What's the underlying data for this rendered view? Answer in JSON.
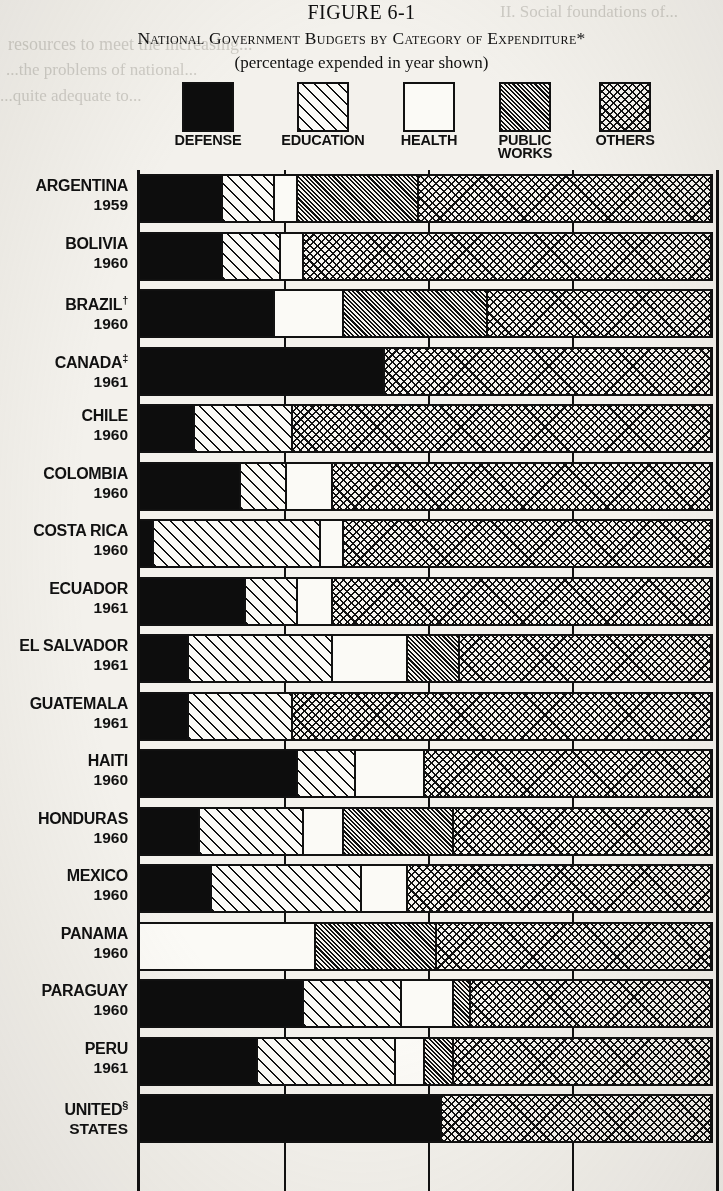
{
  "figure": {
    "number": "FIGURE 6-1",
    "title": "National Government Budgets by Category of Expenditure*",
    "subtitle": "(percentage expended in year shown)"
  },
  "bleed_text": {
    "line1": "II. Social foundations of...",
    "line2": "resources to meet the increasing...",
    "line3": "...the problems of national...",
    "line4": "...quite adequate to...",
    "line5": "..."
  },
  "legend": {
    "items": [
      {
        "label": "DEFENSE",
        "pattern": "p-defense",
        "left": 30,
        "width": 96
      },
      {
        "label": "EDUCATION",
        "pattern": "p-education",
        "left": 140,
        "width": 106
      },
      {
        "label": "HEALTH",
        "pattern": "p-health",
        "left": 258,
        "width": 82
      },
      {
        "label": "PUBLIC\nWORKS",
        "pattern": "p-public",
        "left": 352,
        "width": 86
      },
      {
        "label": "OTHERS",
        "pattern": "p-others",
        "left": 452,
        "width": 86
      }
    ]
  },
  "axis": {
    "gridlines_percent": [
      25,
      50,
      75
    ],
    "range": [
      0,
      100
    ]
  },
  "chart_data": {
    "type": "bar",
    "subtype": "stacked-horizontal-100pct",
    "title": "National Government Budgets by Category of Expenditure*",
    "subtitle": "(percentage expended in year shown)",
    "xlabel": "",
    "ylabel": "",
    "xlim": [
      0,
      100
    ],
    "grid": true,
    "gridlines": [
      25,
      50,
      75
    ],
    "legend_position": "top",
    "series": [
      {
        "name": "DEFENSE",
        "pattern": "p-defense"
      },
      {
        "name": "EDUCATION",
        "pattern": "p-education"
      },
      {
        "name": "HEALTH",
        "pattern": "p-health"
      },
      {
        "name": "PUBLIC WORKS",
        "pattern": "p-public"
      },
      {
        "name": "OTHERS",
        "pattern": "p-others"
      }
    ],
    "categories": [
      "ARGENTINA 1959",
      "BOLIVIA 1960",
      "BRAZIL† 1960",
      "CANADA‡ 1961",
      "CHILE 1960",
      "COLOMBIA 1960",
      "COSTA RICA 1960",
      "ECUADOR 1961",
      "EL SALVADOR 1961",
      "GUATEMALA 1961",
      "HAITI 1960",
      "HONDURAS 1960",
      "MEXICO 1960",
      "PANAMA 1960",
      "PARAGUAY 1960",
      "PERU 1961",
      "UNITED STATES§"
    ],
    "rows": [
      {
        "country": "ARGENTINA",
        "year": "1959",
        "marker": "",
        "values": [
          15,
          9,
          4,
          21,
          51
        ]
      },
      {
        "country": "BOLIVIA",
        "year": "1960",
        "marker": "",
        "values": [
          15,
          10,
          4,
          0,
          71
        ]
      },
      {
        "country": "BRAZIL",
        "year": "1960",
        "marker": "†",
        "values": [
          24,
          0,
          12,
          25,
          39
        ]
      },
      {
        "country": "CANADA",
        "year": "1961",
        "marker": "‡",
        "values": [
          43,
          0,
          0,
          0,
          57
        ]
      },
      {
        "country": "CHILE",
        "year": "1960",
        "marker": "",
        "values": [
          10,
          17,
          0,
          0,
          73
        ]
      },
      {
        "country": "COLOMBIA",
        "year": "1960",
        "marker": "",
        "values": [
          18,
          8,
          8,
          0,
          66
        ]
      },
      {
        "country": "COSTA RICA",
        "year": "1960",
        "marker": "",
        "values": [
          3,
          29,
          4,
          0,
          64
        ]
      },
      {
        "country": "ECUADOR",
        "year": "1961",
        "marker": "",
        "values": [
          19,
          9,
          6,
          0,
          66
        ]
      },
      {
        "country": "EL SALVADOR",
        "year": "1961",
        "marker": "",
        "values": [
          9,
          25,
          13,
          9,
          44
        ]
      },
      {
        "country": "GUATEMALA",
        "year": "1961",
        "marker": "",
        "values": [
          9,
          18,
          0,
          0,
          73
        ]
      },
      {
        "country": "HAITI",
        "year": "1960",
        "marker": "",
        "values": [
          28,
          10,
          12,
          0,
          50
        ]
      },
      {
        "country": "HONDURAS",
        "year": "1960",
        "marker": "",
        "values": [
          11,
          18,
          7,
          19,
          45
        ]
      },
      {
        "country": "MEXICO",
        "year": "1960",
        "marker": "",
        "values": [
          13,
          26,
          8,
          0,
          53
        ]
      },
      {
        "country": "PANAMA",
        "year": "1960",
        "marker": "",
        "values": [
          0,
          0,
          31,
          21,
          48
        ]
      },
      {
        "country": "PARAGUAY",
        "year": "1960",
        "marker": "",
        "values": [
          29,
          17,
          9,
          3,
          42
        ]
      },
      {
        "country": "PERU",
        "year": "1961",
        "marker": "",
        "values": [
          21,
          24,
          5,
          5,
          45
        ]
      },
      {
        "country": "UNITED",
        "year": "STATES",
        "marker": "§",
        "values": [
          53,
          0,
          0,
          0,
          47
        ]
      }
    ]
  }
}
